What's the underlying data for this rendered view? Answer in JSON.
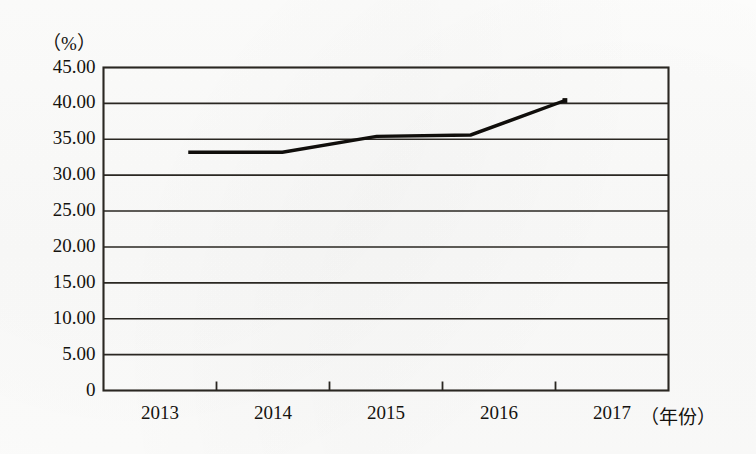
{
  "chart_data": {
    "type": "line",
    "title": "",
    "subtitle": "",
    "xlabel": "（年份）",
    "ylabel": "（%）",
    "categories": [
      "2013",
      "2014",
      "2015",
      "2016",
      "2017"
    ],
    "values": [
      33.2,
      33.2,
      35.4,
      35.6,
      40.4
    ],
    "series": [
      {
        "name": "",
        "values": [
          33.2,
          33.2,
          35.4,
          35.6,
          40.4
        ]
      }
    ],
    "ylim": [
      0,
      45
    ],
    "ytick_labels": [
      "45.00",
      "40.00",
      "35.00",
      "30.00",
      "25.00",
      "20.00",
      "15.00",
      "10.00",
      "5.00",
      "0"
    ],
    "ytick_values": [
      45,
      40,
      35,
      30,
      25,
      20,
      15,
      10,
      5,
      0
    ],
    "xtick_labels": [
      "2013",
      "2014",
      "2015",
      "2016",
      "2017"
    ],
    "grid": true,
    "grid_axis": "y",
    "legend": false,
    "legend_position": "none",
    "line_color": "#100e0b",
    "axis_color": "#2a2722",
    "background_color": "#fdfdfc",
    "marker": "none",
    "annotations": []
  },
  "axis": {
    "unit_top_label": "（%）",
    "x_title": "（年份）"
  }
}
